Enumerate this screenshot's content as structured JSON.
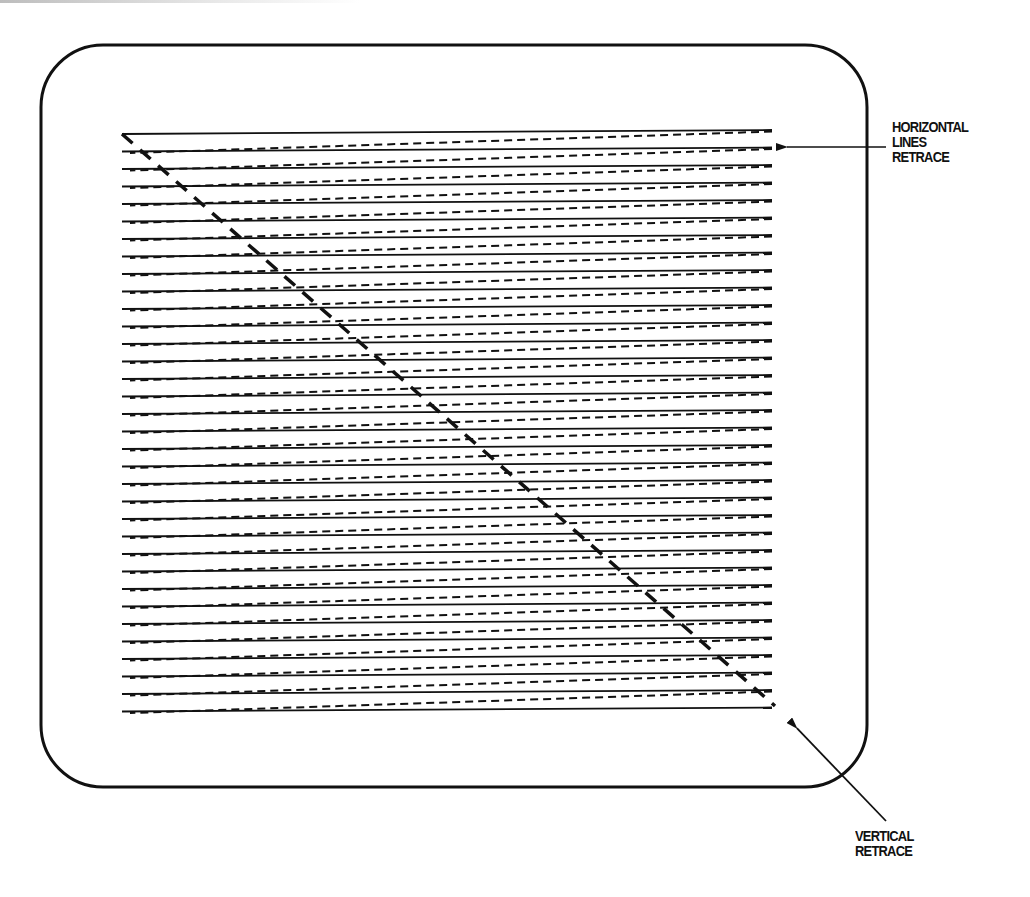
{
  "diagram": {
    "colors": {
      "ink": "#111111",
      "background": "#ffffff"
    },
    "frame": {
      "x": 41,
      "y": 45,
      "width": 826,
      "height": 742,
      "radius": 62,
      "stroke_width": 3
    },
    "raster": {
      "line_count": 34,
      "left_x": 122,
      "right_x": 772,
      "first_left_y": 134,
      "line_spacing": 17.5,
      "rise_per_line": 4,
      "scan_line_style": "solid",
      "retrace_line_style": "dashed"
    },
    "vertical_retrace_path": {
      "start": [
        122,
        134
      ],
      "end": [
        775,
        706
      ],
      "style": "thick-dashed"
    },
    "annotations": {
      "horizontal": {
        "lines": [
          "HORIZONTAL",
          "LINES",
          "RETRACE"
        ],
        "arrow_from": [
          886,
          147
        ],
        "arrow_to": [
          777,
          147
        ]
      },
      "vertical": {
        "lines": [
          "VERTICAL",
          "RETRACE"
        ],
        "arrow_from": [
          886,
          821
        ],
        "arrow_to": [
          790,
          721
        ]
      }
    }
  }
}
